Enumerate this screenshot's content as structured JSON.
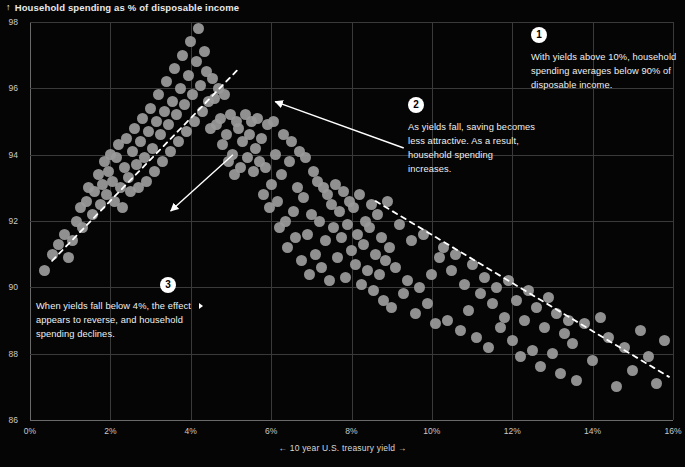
{
  "title": {
    "icon": "arrow-up-icon",
    "glyph": "↑",
    "text": "Household spending as % of disposable income"
  },
  "colors": {
    "background": "#050505",
    "point": "#9b9b9b",
    "grid": "#3a3a3a",
    "axis": "#6a6a6a",
    "text": "#f0f0f0",
    "badge": "#ffffff"
  },
  "annotations": [
    {
      "number": "1",
      "text": "With yields above 10%, household spending averages below 90% of disposable income."
    },
    {
      "number": "2",
      "text": "As yields fall, saving becomes less attractive. As a result, household spending increases."
    },
    {
      "number": "3",
      "text": "When yields fall below 4%, the effect appears to reverse, and household spending declines."
    }
  ],
  "chart_data": {
    "type": "scatter",
    "title": "Household spending as % of disposable income",
    "xlabel": "← 10 year U.S. treasury yield →",
    "ylabel": "Household spending as % of disposable income",
    "xlim": [
      0,
      16
    ],
    "ylim": [
      86,
      98
    ],
    "grid": true,
    "legend": "none",
    "xticks": [
      "0%",
      "2%",
      "4%",
      "6%",
      "8%",
      "10%",
      "12%",
      "14%",
      "16%"
    ],
    "xtick_values": [
      0,
      2,
      4,
      6,
      8,
      10,
      12,
      14,
      16
    ],
    "yticks": [
      "86",
      "88",
      "90",
      "92",
      "94",
      "96",
      "98"
    ],
    "ytick_values": [
      86,
      88,
      90,
      92,
      94,
      96,
      98
    ],
    "x": [
      0.35,
      0.55,
      0.7,
      0.85,
      0.95,
      1.05,
      1.15,
      1.25,
      1.3,
      1.4,
      1.45,
      1.55,
      1.6,
      1.7,
      1.75,
      1.8,
      1.85,
      1.9,
      1.95,
      2.0,
      2.05,
      2.1,
      2.15,
      2.2,
      2.25,
      2.3,
      2.35,
      2.4,
      2.45,
      2.5,
      2.55,
      2.6,
      2.65,
      2.7,
      2.75,
      2.8,
      2.85,
      2.9,
      2.95,
      3.0,
      3.05,
      3.1,
      3.15,
      3.2,
      3.25,
      3.3,
      3.35,
      3.4,
      3.45,
      3.5,
      3.55,
      3.6,
      3.65,
      3.7,
      3.75,
      3.8,
      3.85,
      3.9,
      3.95,
      4.0,
      4.05,
      4.1,
      4.15,
      4.2,
      4.25,
      4.3,
      4.35,
      4.4,
      4.45,
      4.5,
      4.55,
      4.6,
      4.65,
      4.7,
      4.75,
      4.8,
      4.85,
      4.9,
      4.95,
      5.0,
      5.05,
      5.1,
      5.15,
      5.2,
      5.25,
      5.3,
      5.35,
      5.4,
      5.45,
      5.5,
      5.55,
      5.6,
      5.65,
      5.7,
      5.75,
      5.8,
      5.85,
      5.9,
      5.95,
      6.0,
      6.05,
      6.1,
      6.15,
      6.2,
      6.25,
      6.3,
      6.35,
      6.4,
      6.45,
      6.5,
      6.55,
      6.6,
      6.65,
      6.7,
      6.75,
      6.8,
      6.85,
      6.9,
      6.95,
      7.0,
      7.05,
      7.1,
      7.15,
      7.2,
      7.25,
      7.3,
      7.35,
      7.4,
      7.45,
      7.5,
      7.55,
      7.6,
      7.65,
      7.7,
      7.75,
      7.8,
      7.85,
      7.9,
      7.95,
      8.0,
      8.05,
      8.1,
      8.15,
      8.2,
      8.25,
      8.3,
      8.35,
      8.4,
      8.45,
      8.5,
      8.55,
      8.6,
      8.65,
      8.7,
      8.75,
      8.8,
      8.85,
      8.9,
      8.95,
      9.0,
      9.1,
      9.2,
      9.3,
      9.4,
      9.5,
      9.6,
      9.7,
      9.8,
      9.9,
      10.0,
      10.1,
      10.2,
      10.3,
      10.4,
      10.5,
      10.6,
      10.7,
      10.8,
      10.9,
      11.0,
      11.1,
      11.2,
      11.3,
      11.4,
      11.5,
      11.6,
      11.7,
      11.8,
      11.9,
      12.0,
      12.1,
      12.2,
      12.3,
      12.4,
      12.5,
      12.6,
      12.7,
      12.8,
      12.9,
      13.0,
      13.1,
      13.2,
      13.3,
      13.4,
      13.5,
      13.6,
      13.8,
      14.0,
      14.2,
      14.4,
      14.6,
      14.8,
      15.0,
      15.2,
      15.4,
      15.6,
      15.8
    ],
    "y": [
      90.5,
      91.0,
      91.3,
      91.6,
      90.9,
      91.4,
      92.0,
      92.4,
      91.8,
      92.6,
      93.0,
      92.2,
      92.9,
      93.4,
      92.5,
      93.1,
      93.8,
      92.8,
      93.5,
      94.0,
      93.2,
      92.6,
      93.9,
      94.3,
      93.0,
      92.4,
      93.6,
      94.5,
      93.3,
      92.9,
      94.1,
      94.8,
      93.7,
      93.0,
      94.4,
      95.1,
      93.9,
      93.2,
      94.7,
      95.4,
      94.2,
      93.5,
      95.0,
      95.8,
      94.6,
      93.8,
      95.3,
      96.2,
      94.9,
      94.1,
      95.6,
      96.6,
      95.2,
      94.4,
      96.0,
      97.0,
      95.5,
      94.7,
      96.4,
      97.4,
      95.8,
      95.0,
      96.8,
      97.8,
      96.1,
      95.3,
      97.1,
      96.5,
      95.6,
      94.8,
      96.3,
      95.7,
      94.9,
      96.0,
      95.1,
      94.3,
      95.8,
      94.6,
      93.8,
      95.2,
      94.0,
      93.4,
      95.0,
      94.8,
      93.6,
      94.4,
      95.2,
      93.9,
      94.6,
      95.0,
      93.5,
      94.2,
      95.1,
      93.8,
      94.5,
      92.8,
      93.6,
      94.9,
      92.4,
      93.1,
      95.0,
      94.0,
      92.6,
      91.8,
      93.4,
      94.6,
      92.0,
      91.2,
      93.8,
      94.4,
      92.3,
      91.5,
      93.0,
      94.1,
      90.8,
      92.7,
      93.9,
      91.6,
      90.4,
      92.2,
      93.5,
      91.0,
      93.2,
      92.0,
      90.6,
      93.0,
      91.4,
      92.8,
      90.2,
      92.5,
      91.8,
      93.1,
      90.9,
      92.3,
      91.5,
      92.9,
      90.3,
      91.9,
      92.6,
      91.1,
      92.4,
      90.7,
      91.6,
      92.8,
      90.1,
      91.3,
      92.0,
      90.5,
      91.8,
      92.5,
      89.9,
      91.0,
      92.2,
      90.4,
      91.5,
      89.6,
      90.8,
      92.6,
      91.2,
      89.4,
      90.6,
      91.9,
      89.8,
      90.2,
      91.4,
      89.2,
      90.0,
      91.6,
      89.5,
      90.4,
      88.9,
      90.9,
      91.2,
      89.0,
      90.5,
      91.0,
      88.7,
      90.1,
      89.3,
      90.7,
      88.5,
      89.8,
      90.3,
      88.2,
      89.5,
      90.0,
      88.8,
      89.1,
      90.2,
      88.4,
      89.6,
      87.9,
      89.0,
      89.9,
      88.1,
      89.4,
      87.6,
      88.8,
      89.7,
      88.0,
      89.2,
      87.4,
      88.6,
      89.0,
      88.3,
      87.2,
      88.9,
      87.8,
      89.1,
      88.5,
      87.0,
      88.2,
      87.5,
      88.7,
      87.9,
      87.1,
      88.4,
      87.7,
      87.3,
      88.0
    ]
  },
  "trendlines": [
    {
      "name": "rising-trend-left",
      "style": "dashed",
      "x1": 0.55,
      "y1": 90.8,
      "x2": 5.2,
      "y2": 96.6
    },
    {
      "name": "falling-trend-right",
      "style": "dashed",
      "x1": 8.6,
      "y1": 92.6,
      "x2": 15.9,
      "y2": 87.3
    }
  ],
  "callout_arrows": [
    {
      "name": "arrow-to-peak-cluster",
      "x1": 9.3,
      "y1": 94.2,
      "x2": 6.1,
      "y2": 95.6
    },
    {
      "name": "arrow-to-rising-trend",
      "x1": 5.05,
      "y1": 94.0,
      "x2": 3.5,
      "y2": 92.3
    }
  ]
}
